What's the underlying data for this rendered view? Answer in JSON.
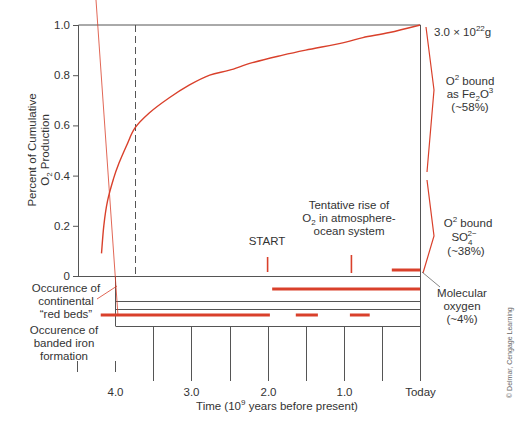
{
  "chart_data": {
    "type": "line",
    "title": "",
    "ylabel_line1": "Percent of Cumulative",
    "ylabel_line2": "O",
    "ylabel_sub": "2",
    "ylabel_line2_rest": " Production",
    "xlabel_pre": "Time (10",
    "xlabel_sup": "9",
    "xlabel_post": " years before present)",
    "ylim": [
      0,
      1.0
    ],
    "xlim": [
      4.6,
      0
    ],
    "y_ticks": [
      "0",
      "0.2",
      "0.4",
      "0.6",
      "0.8",
      "1.0"
    ],
    "x_ticks": [
      {
        "value": 4.5,
        "label": ""
      },
      {
        "value": 4.0,
        "label": "4.0"
      },
      {
        "value": 3.5,
        "label": ""
      },
      {
        "value": 3.0,
        "label": "3.0"
      },
      {
        "value": 2.5,
        "label": ""
      },
      {
        "value": 2.0,
        "label": "2.0"
      },
      {
        "value": 1.5,
        "label": ""
      },
      {
        "value": 1.0,
        "label": "1.0"
      },
      {
        "value": 0.5,
        "label": ""
      },
      {
        "value": 0.0,
        "label": "Today"
      }
    ],
    "series": [
      {
        "name": "Cumulative O2 production",
        "color": "#d9402b",
        "x": [
          4.18,
          4.15,
          4.1,
          4.02,
          3.95,
          3.85,
          3.74,
          3.55,
          3.29,
          3.03,
          2.76,
          2.5,
          2.2,
          1.8,
          1.5,
          1.0,
          0.75,
          0.4,
          0.0
        ],
        "y": [
          0.09,
          0.2,
          0.3,
          0.39,
          0.45,
          0.52,
          0.59,
          0.65,
          0.71,
          0.76,
          0.8,
          0.82,
          0.85,
          0.88,
          0.9,
          0.93,
          0.95,
          0.97,
          1.0
        ]
      }
    ],
    "dashed_marker_x": 3.74,
    "annotations": {
      "total": {
        "pre": "3.0 × 10",
        "sup": "22",
        "post": "g"
      },
      "fe_line1_pre": "O",
      "fe_line1_sup": "2",
      "fe_line1_post": " bound",
      "fe_line2_pre": "as Fe",
      "fe_line2_sub": "2",
      "fe_line2_mid": "O",
      "fe_line2_sup": "3",
      "fe_line3": "(~58%)",
      "so_line1_pre": "O",
      "so_line1_sup": "2",
      "so_line1_post": " bound",
      "so_line2_pre": "SO",
      "so_line2_sub": "4",
      "so_line2_sup": "2−",
      "so_line3": "(~38%)",
      "mol_line1": "Molecular",
      "mol_line2": "oxygen",
      "mol_line3": "(~4%)",
      "start": "START",
      "start_x": 2.0,
      "tentative_line1": "Tentative rise of",
      "tentative_line2_pre": "O",
      "tentative_line2_sub": "2",
      "tentative_line2_post": " in atmosphere-",
      "tentative_line3": "ocean system",
      "tentative_x": 0.9
    },
    "rows": [
      {
        "label_lines": [
          "Occurence of",
          "continental",
          "“red beds”"
        ],
        "bars": [
          [
            1.94,
            0.0
          ]
        ]
      },
      {
        "label_lines": [
          "Occurence of",
          "banded iron",
          "formation"
        ],
        "bars": [
          [
            4.19,
            1.97
          ],
          [
            1.63,
            1.34
          ],
          [
            0.92,
            0.66
          ]
        ]
      }
    ],
    "molecular_oxygen_bar": [
      0.37,
      0.0
    ],
    "grid": false,
    "legend": "none"
  },
  "credit": "© Delmar, Cengage Learning"
}
